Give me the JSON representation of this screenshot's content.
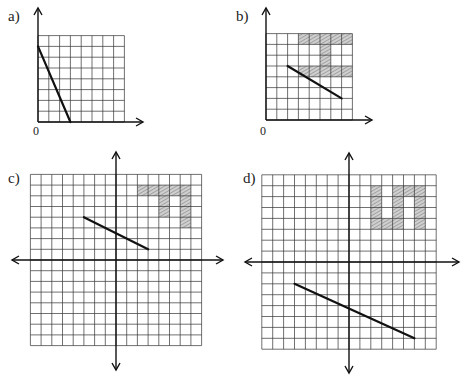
{
  "panels": [
    {
      "id": "a",
      "label": "a)",
      "origin_label": "0",
      "quadrant": "first",
      "grid": {
        "cols": 8,
        "rows": 8,
        "x_range": [
          0,
          8
        ],
        "y_range": [
          0,
          8
        ]
      },
      "segment": {
        "from": [
          0,
          7
        ],
        "to": [
          3,
          0
        ]
      },
      "shaded_cells": []
    },
    {
      "id": "b",
      "label": "b)",
      "origin_label": "0",
      "quadrant": "first",
      "grid": {
        "cols": 8,
        "rows": 8,
        "x_range": [
          0,
          8
        ],
        "y_range": [
          0,
          8
        ]
      },
      "segment": {
        "from": [
          2,
          5
        ],
        "to": [
          7,
          2
        ]
      },
      "shaded_regions": [
        {
          "x": [
            3,
            8
          ],
          "y": [
            7,
            8
          ]
        },
        {
          "x": [
            5,
            6
          ],
          "y": [
            5,
            7
          ]
        },
        {
          "x": [
            3,
            8
          ],
          "y": [
            4,
            5
          ]
        }
      ]
    },
    {
      "id": "c",
      "label": "c)",
      "quadrant": "all",
      "grid": {
        "cols": 16,
        "rows": 16,
        "x_range": [
          -8,
          8
        ],
        "y_range": [
          -8,
          8
        ]
      },
      "segment": {
        "from": [
          -3,
          4
        ],
        "to": [
          3,
          1
        ]
      },
      "shaded_regions": [
        {
          "x": [
            2,
            7
          ],
          "y": [
            6,
            7
          ]
        },
        {
          "x": [
            4,
            5
          ],
          "y": [
            4,
            6
          ]
        },
        {
          "x": [
            6,
            7
          ],
          "y": [
            3,
            6
          ]
        }
      ]
    },
    {
      "id": "d",
      "label": "d)",
      "quadrant": "all",
      "grid": {
        "cols": 16,
        "rows": 16,
        "x_range": [
          -8,
          8
        ],
        "y_range": [
          -8,
          8
        ]
      },
      "segment": {
        "from": [
          -5,
          -2
        ],
        "to": [
          6,
          -7
        ]
      },
      "shaded_regions": [
        {
          "x": [
            2,
            3
          ],
          "y": [
            3,
            7
          ]
        },
        {
          "x": [
            3,
            5
          ],
          "y": [
            3,
            4
          ]
        },
        {
          "x": [
            4,
            7
          ],
          "y": [
            6,
            7
          ]
        },
        {
          "x": [
            4,
            5
          ],
          "y": [
            4,
            6
          ]
        },
        {
          "x": [
            6,
            7
          ],
          "y": [
            3,
            6
          ]
        }
      ]
    }
  ],
  "colors": {
    "grid": "#333333",
    "segment": "#111111",
    "shade": "#9a9a9a",
    "axis": "#111111"
  }
}
